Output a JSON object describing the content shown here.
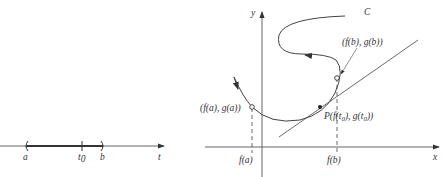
{
  "figure": {
    "left_panel": {
      "axis_label": "t",
      "interval_start": "a",
      "interval_end": "b",
      "point": "t",
      "point_subscript": "0"
    },
    "right_panel": {
      "x_axis_label": "x",
      "y_axis_label": "y",
      "curve_label": "C",
      "start_point_label": "(f(a), g(a))",
      "end_point_label": "(f(b), g(b))",
      "tangent_point_prefix": "P(",
      "tangent_point_f": "f(t",
      "tangent_point_sub": "0",
      "tangent_point_mid": "), g(t",
      "tangent_point_sub2": "0",
      "tangent_point_end": "))",
      "x_tick_a": "f(a)",
      "x_tick_b": "f(b)"
    },
    "colors": {
      "line": "#444444",
      "text": "#333333"
    }
  }
}
